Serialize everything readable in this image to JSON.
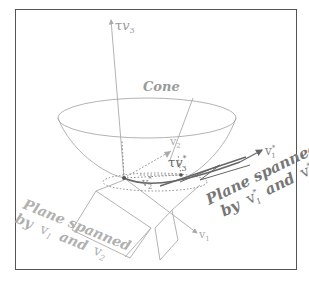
{
  "diagram": {
    "labels": {
      "axis_top": "τv⃗₃",
      "axis_top_tau": "τ",
      "axis_top_v": "v",
      "axis_top_sub": "3",
      "cone": "Cone",
      "v2": "v",
      "v2_sub": "2",
      "tau_v3_star_tau": "τ",
      "tau_v3_star_v": "v",
      "tau_v3_star_sub": "3",
      "tau_v3_star_sup": "*",
      "v2_star_v": "v",
      "v2_star_sub": "2",
      "v2_star_sup": "*",
      "v1_star_v": "v",
      "v1_star_sub": "1",
      "v1_star_sup": "*",
      "v1_v": "v",
      "v1_sub": "1",
      "plane_left_line1": "Plane spanned",
      "plane_left_line2_by": "by",
      "plane_left_line2_v1": "v",
      "plane_left_line2_v1_sub": "1",
      "plane_left_line2_and": "and",
      "plane_left_line2_v2": "v",
      "plane_left_line2_v2_sub": "2",
      "plane_right_line1": "Plane spanned",
      "plane_right_line2_by": "by",
      "plane_right_line2_v1": "v",
      "plane_right_line2_v1_sub": "1",
      "plane_right_line2_v1_sup": "*",
      "plane_right_line2_and": "and",
      "plane_right_line2_v2": "v",
      "plane_right_line2_v2_sub": "2",
      "plane_right_line2_v2_sup": "*"
    },
    "colors": {
      "frame": "#555555",
      "light_line": "#aaaaaa",
      "dark_line": "#666666",
      "left_plane_text": "#b0b0b0",
      "right_plane_text": "#777777",
      "cone_text": "#9a9a9a"
    }
  }
}
